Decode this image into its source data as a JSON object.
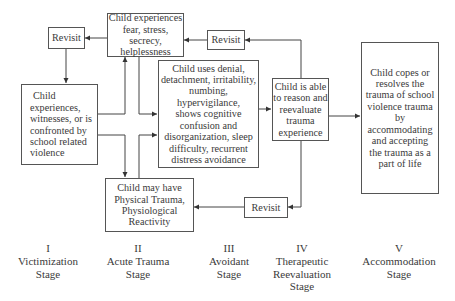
{
  "boxes": {
    "fear": {
      "lines": [
        "Child experiences",
        "fear, stress, secrecy,",
        "helplessness"
      ]
    },
    "revisit_top_left": {
      "label": "Revisit"
    },
    "revisit_top_right": {
      "label": "Revisit"
    },
    "revisit_bottom": {
      "label": "Revisit"
    },
    "victim": {
      "lines": [
        "Child",
        "experiences,",
        "witnesses, or is",
        "confronted by",
        "school related",
        "violence"
      ]
    },
    "avoidant": {
      "lines": [
        "Child uses denial,",
        "detachment, irritability,",
        "numbing, hypervigilance,",
        "shows cognitive",
        "confusion and",
        "disorganization, sleep",
        "difficulty, recurrent",
        "distress avoidance"
      ]
    },
    "reevaluate": {
      "lines": [
        "Child is able",
        "to reason and",
        "reevaluate",
        "trauma",
        "experience"
      ]
    },
    "accommodation": {
      "lines": [
        "Child copes or",
        "resolves the",
        "trauma of school",
        "violence trauma",
        "by",
        "accommodating",
        "and accepting",
        "the trauma as a",
        "part of life"
      ]
    },
    "physical": {
      "lines": [
        "Child may have",
        "Physical Trauma,",
        "Physiological",
        "Reactivity"
      ]
    }
  },
  "stages": [
    {
      "numeral": "I",
      "lines": [
        "Victimization",
        "Stage"
      ]
    },
    {
      "numeral": "II",
      "lines": [
        "Acute Trauma",
        "Stage"
      ]
    },
    {
      "numeral": "III",
      "lines": [
        "Avoidant",
        "Stage"
      ]
    },
    {
      "numeral": "IV",
      "lines": [
        "Therapeutic",
        "Reevaluation",
        "Stage"
      ]
    },
    {
      "numeral": "V",
      "lines": [
        "Accommodation",
        "Stage"
      ]
    }
  ]
}
